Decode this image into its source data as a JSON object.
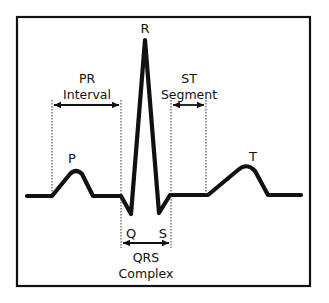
{
  "diagram": {
    "colors": {
      "ink": "#111111",
      "background": "#ffffff"
    },
    "waves": {
      "P": "P",
      "Q": "Q",
      "R": "R",
      "S": "S",
      "T": "T"
    },
    "intervals": {
      "pr": {
        "line1": "PR",
        "line2": "Interval"
      },
      "st": {
        "line1": "ST",
        "line2": "Segment"
      },
      "qrs": {
        "line1": "QRS",
        "line2": "Complex"
      }
    }
  }
}
